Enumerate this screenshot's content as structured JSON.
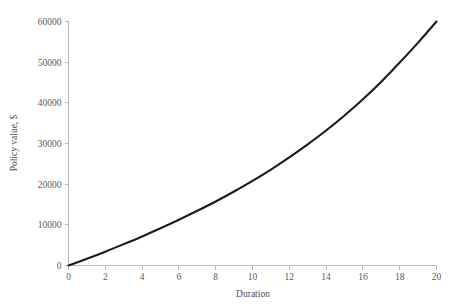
{
  "chart_data": {
    "type": "line",
    "title": "",
    "xlabel": "Duration",
    "ylabel": "Policy value, $",
    "xlim": [
      0,
      20
    ],
    "ylim": [
      0,
      60000
    ],
    "grid": false,
    "legend": null,
    "x_ticks": [
      "0",
      "2",
      "4",
      "6",
      "8",
      "10",
      "12",
      "14",
      "16",
      "18",
      "20"
    ],
    "y_ticks": [
      "0",
      "10000",
      "20000",
      "30000",
      "40000",
      "50000",
      "60000"
    ],
    "series": [
      {
        "name": "Policy value",
        "x": [
          0,
          1,
          2,
          3,
          4,
          5,
          6,
          7,
          8,
          9,
          10,
          11,
          12,
          13,
          14,
          15,
          16,
          17,
          18,
          19,
          20
        ],
        "values": [
          0,
          1650,
          3400,
          5250,
          7150,
          9150,
          11250,
          13450,
          15750,
          18200,
          20800,
          23600,
          26600,
          29800,
          33200,
          36900,
          40900,
          45200,
          49900,
          54800,
          60000
        ]
      }
    ]
  },
  "axes": {
    "x_title": "Duration",
    "y_title": "Policy value, $"
  },
  "colors": {
    "curve": "#1b1b1b",
    "axis": "#b9b9bb",
    "text": "#59595b",
    "background": "#ffffff"
  }
}
